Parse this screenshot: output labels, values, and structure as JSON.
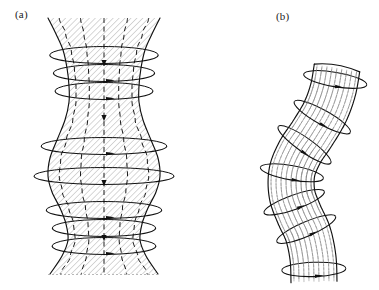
{
  "figure": {
    "kind": "scientific-line-drawing",
    "background_color": "#ffffff",
    "ink_color": "#111111",
    "hatch_color": "#6f6f6f",
    "width": 379,
    "height": 290
  },
  "panels": [
    {
      "id": "a",
      "label": "(a)",
      "name": "sausage-instability-panel",
      "label_position": {
        "x": 15,
        "y": 8
      },
      "tube": {
        "name": "flux-tube-sausage",
        "axis_x": 104,
        "top_y": 18,
        "bottom_y": 274,
        "hatch_angle_deg": 45,
        "hatch_spacing": 4.2,
        "profile_half_widths": [
          {
            "y": 18,
            "hw": 56
          },
          {
            "y": 34,
            "hw": 48
          },
          {
            "y": 50,
            "hw": 41
          },
          {
            "y": 68,
            "hw": 37
          },
          {
            "y": 86,
            "hw": 35
          },
          {
            "y": 102,
            "hw": 35
          },
          {
            "y": 120,
            "hw": 39
          },
          {
            "y": 140,
            "hw": 47
          },
          {
            "y": 158,
            "hw": 54
          },
          {
            "y": 176,
            "hw": 56
          },
          {
            "y": 192,
            "hw": 52
          },
          {
            "y": 208,
            "hw": 44
          },
          {
            "y": 224,
            "hw": 38
          },
          {
            "y": 240,
            "hw": 36
          },
          {
            "y": 256,
            "hw": 42
          },
          {
            "y": 274,
            "hw": 54
          }
        ],
        "rings_y": [
          55,
          73,
          91,
          146,
          176,
          210,
          228,
          246
        ],
        "axial_fieldlines_count": 5,
        "ring_arrow_direction": "rightward-at-front",
        "axial_arrow_direction": "downward"
      }
    },
    {
      "id": "b",
      "label": "(b)",
      "name": "kink-instability-panel",
      "label_position": {
        "x": 276,
        "y": 10
      },
      "tube": {
        "name": "flux-tube-kink",
        "top_y": 68,
        "bottom_y": 286,
        "hatch_along_axis": true,
        "hatch_color": "#7a7a7a",
        "half_width": 23,
        "axis_points": [
          {
            "x": 337,
            "y": 68
          },
          {
            "x": 333,
            "y": 90
          },
          {
            "x": 325,
            "y": 112
          },
          {
            "x": 312,
            "y": 134
          },
          {
            "x": 300,
            "y": 152
          },
          {
            "x": 292,
            "y": 172
          },
          {
            "x": 292,
            "y": 194
          },
          {
            "x": 299,
            "y": 214
          },
          {
            "x": 308,
            "y": 234
          },
          {
            "x": 313,
            "y": 258
          },
          {
            "x": 314,
            "y": 282
          }
        ],
        "rings_t": [
          0.06,
          0.22,
          0.36,
          0.5,
          0.64,
          0.78,
          0.94
        ],
        "ring_arrow_direction": "rightward-at-front"
      }
    }
  ],
  "caption_texts": {
    "panel_a": "(a)",
    "panel_b": "(b)"
  }
}
